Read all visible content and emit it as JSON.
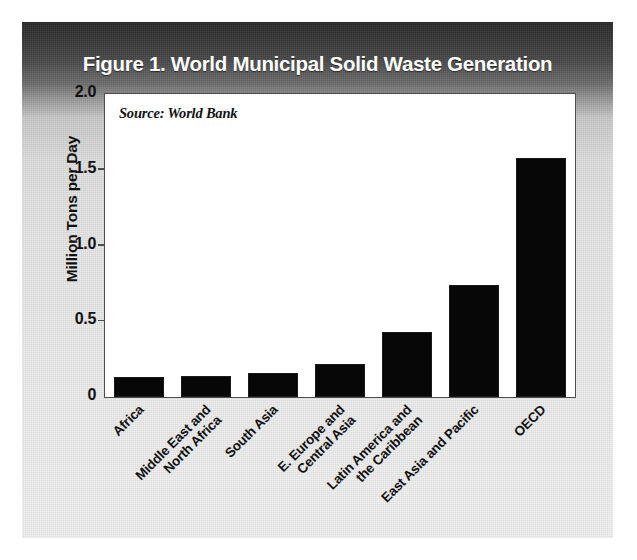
{
  "figure": {
    "title": "Figure 1. World Municipal Solid Waste Generation",
    "source_note": "Source: World Bank",
    "colors": {
      "bar": "#070707",
      "frame": "#4d4d4d",
      "title_text": "#ffffff",
      "plot_background": "#ffffff",
      "panel_top": "#2a2a2a",
      "panel_bottom": "#f0f0f0"
    }
  },
  "chart_data": {
    "type": "bar",
    "title": "Figure 1. World Municipal Solid Waste Generation",
    "subtitle": "Source: World Bank",
    "xlabel": "",
    "ylabel": "Million Tons per Day",
    "categories": [
      "Africa",
      "Middle East and North Africa",
      "South Asia",
      "E. Europe and Central Asia",
      "Latin America and the Caribbean",
      "East Asia and Pacific",
      "OECD"
    ],
    "category_lines": [
      [
        "Africa"
      ],
      [
        "Middle East and",
        "North Africa"
      ],
      [
        "South Asia"
      ],
      [
        "E. Europe and",
        "Central Asia"
      ],
      [
        "Latin America and",
        "the Caribbean"
      ],
      [
        "East Asia and Pacific"
      ],
      [
        "OECD"
      ]
    ],
    "values": [
      0.13,
      0.14,
      0.16,
      0.22,
      0.43,
      0.74,
      1.58
    ],
    "ylim": [
      0,
      2.0
    ],
    "yticks": [
      0,
      0.5,
      1.0,
      1.5,
      2.0
    ],
    "ytick_labels": [
      "0",
      "0.5",
      "1.0",
      "1.5",
      "2.0"
    ],
    "grid": false,
    "legend": "none",
    "series": [
      {
        "name": "Municipal Solid Waste Generation",
        "values": [
          0.13,
          0.14,
          0.16,
          0.22,
          0.43,
          0.74,
          1.58
        ]
      }
    ]
  }
}
